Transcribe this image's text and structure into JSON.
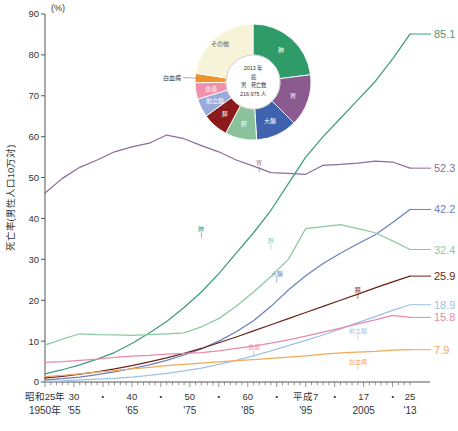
{
  "chart_data": {
    "type": "line",
    "title": "",
    "xlabel": "",
    "ylabel": "死亡率(男性人口10万対)",
    "unit_label": "(%)",
    "ylim": [
      0,
      90
    ],
    "ytick_values": [
      0,
      10,
      20,
      30,
      40,
      50,
      60,
      70,
      80,
      90
    ],
    "xlim": [
      1950,
      2013
    ],
    "grid": false,
    "legend": "inline-labels",
    "xaxis_rows": [
      {
        "name": "era",
        "ticks": [
          {
            "label": "昭和25年",
            "x": 1950
          },
          {
            "label": "30",
            "x": 1955
          },
          {
            "label": "・",
            "x": 1960
          },
          {
            "label": "40",
            "x": 1965
          },
          {
            "label": "・",
            "x": 1970
          },
          {
            "label": "50",
            "x": 1975
          },
          {
            "label": "・",
            "x": 1980
          },
          {
            "label": "60",
            "x": 1985
          },
          {
            "label": "・",
            "x": 1990
          },
          {
            "label": "平成7",
            "x": 1995
          },
          {
            "label": "・",
            "x": 2000
          },
          {
            "label": "17",
            "x": 2005
          },
          {
            "label": "・",
            "x": 2010
          },
          {
            "label": "25",
            "x": 2013
          }
        ]
      },
      {
        "name": "western",
        "ticks": [
          {
            "label": "1950年",
            "x": 1950
          },
          {
            "label": "'55",
            "x": 1955
          },
          {
            "label": "'65",
            "x": 1965
          },
          {
            "label": "'75",
            "x": 1975
          },
          {
            "label": "'85",
            "x": 1985
          },
          {
            "label": "'95",
            "x": 1995
          },
          {
            "label": "2005",
            "x": 2005
          },
          {
            "label": "'13",
            "x": 2013
          }
        ]
      }
    ],
    "series": [
      {
        "name": "肺",
        "label": "肺",
        "end_value": "85.1",
        "color": "#3f9c7d",
        "label_x": 1977,
        "label_y": 37,
        "x": [
          1950,
          1953,
          1956,
          1959,
          1962,
          1965,
          1968,
          1971,
          1974,
          1977,
          1980,
          1983,
          1986,
          1989,
          1992,
          1995,
          1998,
          2001,
          2004,
          2007,
          2010,
          2013
        ],
        "values": [
          2.0,
          3.0,
          4.2,
          5.6,
          7.2,
          9.4,
          12.0,
          14.8,
          18.2,
          22.0,
          26.5,
          31.5,
          36.5,
          42.0,
          48.5,
          55.0,
          60.0,
          64.5,
          69.0,
          73.5,
          79.0,
          85.1
        ]
      },
      {
        "name": "胃",
        "label": "胃",
        "end_value": "52.3",
        "color": "#8a6e9e",
        "label_x": 1987,
        "label_y": 53,
        "x": [
          1950,
          1953,
          1956,
          1959,
          1962,
          1965,
          1968,
          1971,
          1974,
          1977,
          1980,
          1983,
          1986,
          1989,
          1992,
          1995,
          1998,
          2001,
          2004,
          2007,
          2010,
          2013
        ],
        "values": [
          46.2,
          49.8,
          52.5,
          54.3,
          56.3,
          57.5,
          58.4,
          60.4,
          59.5,
          57.8,
          56.3,
          54.3,
          52.8,
          51.2,
          51.0,
          50.8,
          53.0,
          53.2,
          53.5,
          54.0,
          53.8,
          52.3
        ]
      },
      {
        "name": "大腸",
        "label": "大腸",
        "end_value": "42.2",
        "color": "#6a81c0",
        "label_x": 1990,
        "label_y": 26,
        "x": [
          1950,
          1953,
          1956,
          1959,
          1962,
          1965,
          1968,
          1971,
          1974,
          1977,
          1980,
          1983,
          1986,
          1989,
          1992,
          1995,
          1998,
          2001,
          2004,
          2007,
          2010,
          2013
        ],
        "values": [
          0.5,
          0.8,
          1.2,
          1.8,
          2.5,
          3.3,
          4.2,
          5.3,
          6.6,
          8.1,
          10.0,
          12.3,
          15.0,
          18.5,
          22.5,
          26.0,
          29.0,
          31.5,
          33.8,
          36.0,
          39.0,
          42.2
        ]
      },
      {
        "name": "肝",
        "label": "肝",
        "end_value": "32.4",
        "color": "#8cc9a3",
        "label_x": 1989,
        "label_y": 34,
        "x": [
          1950,
          1953,
          1956,
          1959,
          1962,
          1965,
          1968,
          1971,
          1974,
          1977,
          1980,
          1983,
          1986,
          1989,
          1992,
          1995,
          1998,
          2001,
          2004,
          2007,
          2010,
          2013
        ],
        "values": [
          9.0,
          10.5,
          11.8,
          11.6,
          11.5,
          11.4,
          11.6,
          11.8,
          12.0,
          13.5,
          15.5,
          18.5,
          22.0,
          25.8,
          30.0,
          37.5,
          38.0,
          38.5,
          37.5,
          36.5,
          34.5,
          32.4
        ]
      },
      {
        "name": "膵",
        "label": "膵",
        "end_value": "25.9",
        "color": "#6b2318",
        "label_x": 2004,
        "label_y": 22,
        "x": [
          1950,
          1953,
          1956,
          1959,
          1962,
          1965,
          1968,
          1971,
          1974,
          1977,
          1980,
          1983,
          1986,
          1989,
          1992,
          1995,
          1998,
          2001,
          2004,
          2007,
          2010,
          2013
        ],
        "values": [
          1.0,
          1.4,
          1.9,
          2.5,
          3.2,
          4.0,
          4.9,
          5.9,
          7.0,
          8.2,
          9.6,
          11.0,
          12.5,
          14.0,
          15.5,
          17.0,
          18.5,
          20.0,
          21.5,
          23.0,
          24.5,
          25.9
        ]
      },
      {
        "name": "前立腺",
        "label": "前立腺",
        "end_value": "18.9",
        "color": "#9fc0e8",
        "label_x": 2004,
        "label_y": 12,
        "x": [
          1950,
          1953,
          1956,
          1959,
          1962,
          1965,
          1968,
          1971,
          1974,
          1977,
          1980,
          1983,
          1986,
          1989,
          1992,
          1995,
          1998,
          2001,
          2004,
          2007,
          2010,
          2013
        ],
        "values": [
          0.2,
          0.3,
          0.5,
          0.7,
          0.9,
          1.2,
          1.6,
          2.1,
          2.7,
          3.4,
          4.3,
          5.3,
          6.4,
          7.6,
          8.9,
          10.2,
          11.5,
          13.0,
          14.5,
          16.0,
          17.5,
          18.9
        ]
      },
      {
        "name": "食道",
        "label": "食道",
        "end_value": "15.8",
        "color": "#e88aa8",
        "label_x": 1986,
        "label_y": 8,
        "x": [
          1950,
          1953,
          1956,
          1959,
          1962,
          1965,
          1968,
          1971,
          1974,
          1977,
          1980,
          1983,
          1986,
          1989,
          1992,
          1995,
          1998,
          2001,
          2004,
          2007,
          2010,
          2013
        ],
        "values": [
          4.8,
          5.0,
          5.3,
          5.6,
          6.0,
          6.3,
          6.5,
          6.8,
          7.0,
          7.2,
          7.6,
          8.2,
          8.8,
          9.5,
          10.3,
          11.2,
          12.2,
          13.2,
          14.2,
          15.2,
          16.3,
          15.8
        ]
      },
      {
        "name": "白血病",
        "label": "白血病",
        "end_value": "7.9",
        "color": "#f0a95c",
        "label_x": 2004,
        "label_y": 4.5,
        "x": [
          1950,
          1953,
          1956,
          1959,
          1962,
          1965,
          1968,
          1971,
          1974,
          1977,
          1980,
          1983,
          1986,
          1989,
          1992,
          1995,
          1998,
          2001,
          2004,
          2007,
          2010,
          2013
        ],
        "values": [
          1.3,
          1.6,
          2.0,
          2.4,
          2.8,
          3.2,
          3.6,
          4.0,
          4.3,
          4.6,
          4.9,
          5.2,
          5.5,
          5.8,
          6.1,
          6.4,
          6.8,
          7.1,
          7.3,
          7.5,
          7.8,
          7.9
        ]
      }
    ]
  },
  "pie": {
    "center_lines": [
      "2013 年",
      "癌",
      "男　死亡数",
      "216,975 人"
    ],
    "slices": [
      {
        "label": "肺",
        "value": 23.0,
        "color": "#2e9b68",
        "label_color": "#ffffff",
        "inside": true
      },
      {
        "label": "胃",
        "value": 14.5,
        "color": "#8b5a8f",
        "label_color": "#ffffff",
        "inside": true
      },
      {
        "label": "大腸",
        "value": 11.5,
        "color": "#3f63ae",
        "label_color": "#ffffff",
        "inside": true
      },
      {
        "label": "肝",
        "value": 8.8,
        "color": "#8cc29b",
        "label_color": "#ffffff",
        "inside": true
      },
      {
        "label": "膵",
        "value": 7.2,
        "color": "#8b1a1a",
        "label_color": "#ffffff",
        "inside": true
      },
      {
        "label": "前立腺",
        "value": 5.2,
        "color": "#9aaada",
        "label_color": "#ffffff",
        "inside": true
      },
      {
        "label": "食道",
        "value": 4.6,
        "color": "#f090ac",
        "label_color": "#ffffff",
        "inside": true
      },
      {
        "label": "白血病",
        "value": 2.6,
        "color": "#f0922e",
        "label_color": "#333333",
        "inside": false
      },
      {
        "label": "その他",
        "value": 22.6,
        "color": "#f7f3d8",
        "label_color": "#555555",
        "inside": true
      }
    ]
  }
}
